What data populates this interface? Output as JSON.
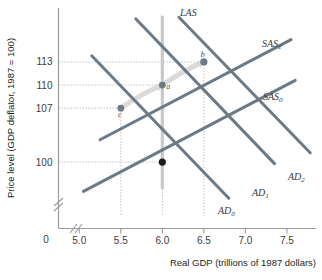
{
  "chart_data": {
    "type": "line",
    "title": "",
    "xlabel": "Real GDP (trillions of 1987 dollars)",
    "ylabel": "Price level (GDP deflator, 1987 = 100)",
    "xlim": [
      4.75,
      7.85
    ],
    "ylim": [
      93,
      120
    ],
    "grid": false,
    "axis_break_x": true,
    "axis_break_y": true,
    "xticks": [
      "5.0",
      "5.5",
      "6.0",
      "6.5",
      "7.0",
      "7.5"
    ],
    "xtick_values": [
      5.0,
      5.5,
      6.0,
      6.5,
      7.0,
      7.5
    ],
    "yticks": [
      "100",
      "107",
      "110",
      "113"
    ],
    "ytick_values": [
      100,
      107,
      110,
      113
    ],
    "origin_label": "0",
    "series": [
      {
        "name": "LAS",
        "label": "LAS",
        "kind": "vertical-line",
        "color": "#c9c9c9",
        "x": 6.0,
        "y_from": 96.5,
        "y_to": 119.0
      },
      {
        "name": "SAS0",
        "label": "SAS",
        "subscript": "0",
        "kind": "upward-sloping",
        "color": "#6b7a86",
        "points": [
          [
            5.05,
            96.2
          ],
          [
            7.6,
            110.6
          ]
        ]
      },
      {
        "name": "SAS1",
        "label": "SAS",
        "subscript": "1",
        "kind": "upward-sloping",
        "color": "#6b7a86",
        "points": [
          [
            5.25,
            102.9
          ],
          [
            7.55,
            115.9
          ]
        ]
      },
      {
        "name": "AD0",
        "label": "AD",
        "subscript": "0",
        "kind": "downward-sloping",
        "color": "#6b7a86",
        "points": [
          [
            5.15,
            113.8
          ],
          [
            6.8,
            95.3
          ]
        ]
      },
      {
        "name": "AD1",
        "label": "AD",
        "subscript": "1",
        "kind": "downward-sloping",
        "color": "#6b7a86",
        "points": [
          [
            5.68,
            118.6
          ],
          [
            7.35,
            99.8
          ]
        ]
      },
      {
        "name": "AD2",
        "label": "AD",
        "subscript": "2",
        "kind": "downward-sloping",
        "color": "#6b7a86",
        "points": [
          [
            6.2,
            118.8
          ],
          [
            7.78,
            101.2
          ]
        ]
      }
    ],
    "points": [
      {
        "name": "initial-equilibrium",
        "label": "",
        "x": 6.0,
        "y": 100,
        "color": "#1a1a1a",
        "radius": 3.6
      },
      {
        "name": "point-c",
        "label": "c",
        "x": 5.5,
        "y": 107,
        "color": "#6b7a86",
        "radius": 3.4,
        "label_dx": -1,
        "label_dy": 9
      },
      {
        "name": "point-a",
        "label": "a",
        "x": 6.0,
        "y": 110,
        "color": "#6b7a86",
        "radius": 3.4,
        "label_dx": 6,
        "label_dy": 4
      },
      {
        "name": "point-b",
        "label": "b",
        "x": 6.5,
        "y": 113,
        "color": "#6b7a86",
        "radius": 3.6,
        "label_dx": -1,
        "label_dy": -5
      }
    ],
    "arrows": [
      {
        "name": "arrow-c-to-a",
        "from": [
          5.5,
          107
        ],
        "to": [
          6.0,
          110
        ],
        "color": "#d8d8d8"
      },
      {
        "name": "arrow-a-to-b",
        "from": [
          6.0,
          110
        ],
        "to": [
          6.5,
          113
        ],
        "color": "#d8d8d8"
      }
    ],
    "dropline_color": "#b5b5b5",
    "droplines_x": [
      5.5,
      6.5
    ],
    "droplines_y": [
      100,
      107,
      110,
      113
    ]
  }
}
